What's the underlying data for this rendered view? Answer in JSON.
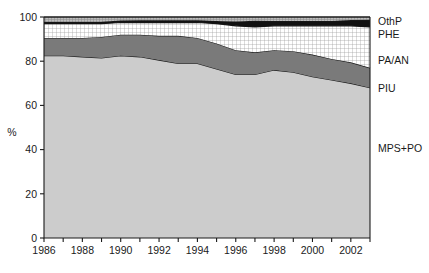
{
  "chart_data": {
    "type": "area",
    "title": "",
    "subtitle": "",
    "xlabel": "",
    "ylabel": "%",
    "stacked": true,
    "stack_total": 100,
    "grid": false,
    "legend_position": "right",
    "xlim": [
      1986,
      2003
    ],
    "ylim": [
      0,
      100
    ],
    "yticks": [
      0,
      20,
      40,
      60,
      80,
      100
    ],
    "ytick_labels": [
      "0",
      "20",
      "40",
      "60",
      "80",
      "100"
    ],
    "xticks": [
      1986,
      1987,
      1988,
      1989,
      1990,
      1991,
      1992,
      1993,
      1994,
      1995,
      1996,
      1997,
      1998,
      1999,
      2000,
      2001,
      2002,
      2003
    ],
    "xtick_labels": [
      "1986",
      "",
      "1988",
      "",
      "1990",
      "",
      "1992",
      "",
      "1994",
      "",
      "1996",
      "",
      "1998",
      "",
      "2000",
      "",
      "2002",
      ""
    ],
    "x": [
      1986,
      1987,
      1988,
      1989,
      1990,
      1991,
      1992,
      1993,
      1994,
      1995,
      1996,
      1997,
      1998,
      1999,
      2000,
      2001,
      2002,
      2003
    ],
    "series": [
      {
        "name": "MPS+PO",
        "fill": "#cccccc",
        "pattern": "solid",
        "values": [
          82.5,
          82.5,
          82.0,
          81.5,
          82.5,
          82.0,
          80.5,
          79.0,
          79.0,
          76.5,
          74.0,
          74.0,
          76.0,
          75.0,
          73.0,
          71.5,
          70.0,
          68.0
        ]
      },
      {
        "name": "PIU",
        "fill": "#7a7a7a",
        "pattern": "solid",
        "values": [
          8.0,
          8.0,
          8.5,
          9.5,
          9.5,
          10.0,
          11.0,
          12.5,
          11.5,
          11.5,
          11.0,
          10.0,
          9.0,
          9.5,
          10.0,
          9.5,
          9.5,
          9.0
        ]
      },
      {
        "name": "PA/AN",
        "fill": "#ffffff",
        "pattern": "grid",
        "values": [
          6.5,
          6.5,
          6.5,
          6.0,
          5.5,
          5.5,
          6.0,
          6.0,
          7.0,
          9.0,
          11.0,
          11.5,
          11.0,
          11.5,
          13.0,
          15.0,
          16.5,
          18.5
        ]
      },
      {
        "name": "PHE",
        "fill": "#111111",
        "pattern": "solid",
        "values": [
          0.8,
          0.8,
          0.8,
          0.9,
          0.9,
          1.0,
          1.0,
          1.0,
          1.0,
          1.2,
          2.0,
          2.8,
          2.2,
          2.2,
          2.2,
          2.2,
          2.6,
          3.2
        ]
      },
      {
        "name": "OthP",
        "fill": "#a8a8a8",
        "pattern": "hatch",
        "values": [
          2.2,
          2.2,
          2.2,
          2.1,
          1.6,
          1.5,
          1.5,
          1.5,
          1.5,
          1.8,
          2.0,
          1.7,
          1.8,
          1.8,
          1.8,
          1.8,
          1.4,
          1.3
        ]
      }
    ],
    "legend": [
      {
        "label": "OthP",
        "fill": "#a8a8a8",
        "pattern": "hatch"
      },
      {
        "label": "PHE",
        "fill": "#111111",
        "pattern": "solid"
      },
      {
        "label": "PA/AN",
        "fill": "#ffffff",
        "pattern": "grid"
      },
      {
        "label": "PIU",
        "fill": "#7a7a7a",
        "pattern": "solid"
      },
      {
        "label": "MPS+PO",
        "fill": "#cccccc",
        "pattern": "solid"
      }
    ]
  }
}
